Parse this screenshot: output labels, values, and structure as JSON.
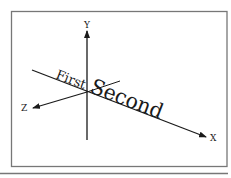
{
  "diagram": {
    "frame": {
      "stroke": "#777777"
    },
    "baseline_rule": {
      "stroke": "#777777"
    },
    "axes": {
      "x": {
        "label": "X"
      },
      "y": {
        "label": "Y"
      },
      "z": {
        "label": "Z"
      }
    },
    "texts": {
      "first": "First",
      "second": "Second"
    },
    "colors": {
      "ink": "#1a1a1a"
    }
  }
}
